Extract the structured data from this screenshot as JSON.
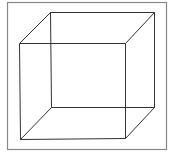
{
  "diagram": {
    "colors": {
      "background": "#ffffff",
      "frame": "#888888",
      "edges": "#333333"
    },
    "frame": {
      "x": 7,
      "y": 2,
      "width": 159,
      "height": 147
    },
    "vertices": {
      "front_top_left": [
        19,
        43
      ],
      "front_top_right": [
        125,
        43
      ],
      "front_bottom_left": [
        20,
        139
      ],
      "front_bottom_right": [
        125,
        138
      ],
      "back_top_left": [
        50,
        12
      ],
      "back_top_right": [
        154,
        12
      ],
      "back_bottom_left": [
        51,
        107
      ],
      "back_bottom_right": [
        154,
        107
      ]
    },
    "edges": [
      [
        "front_top_left",
        "front_top_right"
      ],
      [
        "front_top_right",
        "front_bottom_right"
      ],
      [
        "front_bottom_right",
        "front_bottom_left"
      ],
      [
        "front_bottom_left",
        "front_top_left"
      ],
      [
        "back_top_left",
        "back_top_right"
      ],
      [
        "back_top_right",
        "back_bottom_right"
      ],
      [
        "back_bottom_right",
        "back_bottom_left"
      ],
      [
        "back_bottom_left",
        "back_top_left"
      ],
      [
        "front_top_left",
        "back_top_left"
      ],
      [
        "front_top_right",
        "back_top_right"
      ],
      [
        "front_bottom_left",
        "back_bottom_left"
      ],
      [
        "front_bottom_right",
        "back_bottom_right"
      ]
    ]
  }
}
